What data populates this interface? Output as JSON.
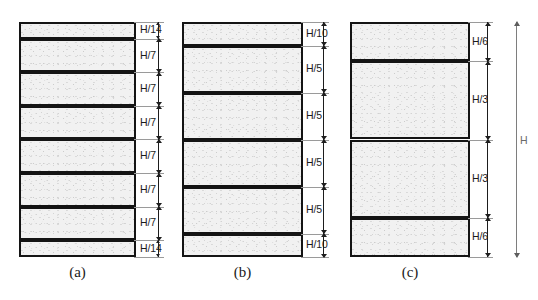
{
  "figure": {
    "overall_dimension": {
      "label": "H",
      "name": "total-height"
    },
    "panels": [
      {
        "id": "a",
        "caption": "(a)",
        "division_count": 7,
        "segments": [
          {
            "label": "H/14",
            "fraction": 0.0714286
          },
          {
            "label": "H/7",
            "fraction": 0.1428571
          },
          {
            "label": "H/7",
            "fraction": 0.1428571
          },
          {
            "label": "H/7",
            "fraction": 0.1428571
          },
          {
            "label": "H/7",
            "fraction": 0.1428571
          },
          {
            "label": "H/7",
            "fraction": 0.1428571
          },
          {
            "label": "H/7",
            "fraction": 0.1428571
          },
          {
            "label": "H/14",
            "fraction": 0.0714286
          }
        ]
      },
      {
        "id": "b",
        "caption": "(b)",
        "division_count": 6,
        "segments": [
          {
            "label": "H/10",
            "fraction": 0.1
          },
          {
            "label": "H/5",
            "fraction": 0.2
          },
          {
            "label": "H/5",
            "fraction": 0.2
          },
          {
            "label": "H/5",
            "fraction": 0.2
          },
          {
            "label": "H/5",
            "fraction": 0.2
          },
          {
            "label": "H/10",
            "fraction": 0.1
          }
        ]
      },
      {
        "id": "c",
        "caption": "(c)",
        "division_count": 4,
        "segments": [
          {
            "label": "H/6",
            "fraction": 0.1666667
          },
          {
            "label": "H/3",
            "fraction": 0.3333333
          },
          {
            "label": "H/3",
            "fraction": 0.3333333
          },
          {
            "label": "H/6",
            "fraction": 0.1666667
          }
        ]
      }
    ]
  },
  "colors": {
    "band_fill": "#f1f1f1",
    "outline": "#141414",
    "dimension": "#1d1d1d",
    "extension": "#9a9a9a",
    "background": "#ffffff"
  }
}
